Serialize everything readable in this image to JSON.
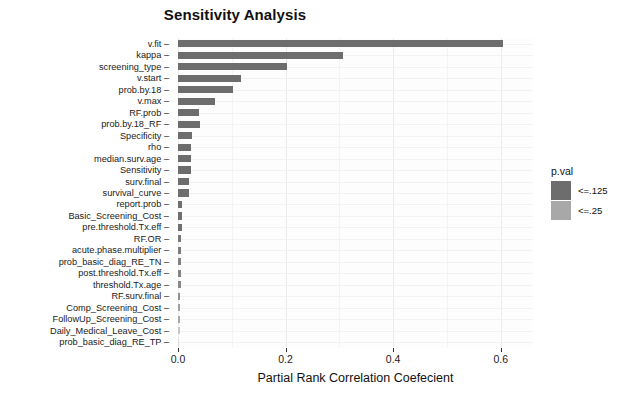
{
  "chart_data": {
    "type": "bar",
    "orientation": "horizontal",
    "title": "Sensitivity Analysis",
    "xlabel": "Partial Rank Correlation Coefecient",
    "ylabel": "",
    "xlim": [
      0.0,
      0.66
    ],
    "xticks": [
      0.0,
      0.2,
      0.4,
      0.6
    ],
    "xticklabels": [
      "0.0",
      "0.2",
      "0.4",
      "0.6"
    ],
    "grid": true,
    "legend_position": "right",
    "legend": {
      "title": "p.val",
      "entries": [
        {
          "label": "<=.125",
          "color": "#6d6d6d"
        },
        {
          "label": "<=.25",
          "color": "#a8a8a8"
        }
      ]
    },
    "categories": [
      "v.fit",
      "kappa",
      "screening_type",
      "v.start",
      "prob.by.18",
      "v.max",
      "RF.prob",
      "prob.by.18_RF",
      "Specificity",
      "rho",
      "median.surv.age",
      "Sensitivity",
      "surv.final",
      "survival_curve",
      "report.prob",
      "Basic_Screening_Cost",
      "pre.threshold.Tx.eff",
      "RF.OR",
      "acute.phase.multiplier",
      "prob_basic_diag_RE_TN",
      "post.threshold.Tx.eff",
      "threshold.Tx.age",
      "RF.surv.final",
      "Comp_Screening_Cost",
      "FollowUp_Screening_Cost",
      "Daily_Medical_Leave_Cost",
      "prob_basic_diag_RE_TP"
    ],
    "values": [
      0.605,
      0.307,
      0.203,
      0.117,
      0.102,
      0.069,
      0.039,
      0.041,
      0.026,
      0.024,
      0.024,
      0.024,
      0.021,
      0.021,
      0.008,
      0.008,
      0.007,
      0.005,
      0.005,
      0.005,
      0.005,
      0.005,
      0.004,
      0.004,
      0.004,
      0.003,
      0.002
    ],
    "groups": [
      "<=.125",
      "<=.125",
      "<=.125",
      "<=.125",
      "<=.125",
      "<=.125",
      "<=.125",
      "<=.125",
      "<=.125",
      "<=.125",
      "<=.125",
      "<=.125",
      "<=.125",
      "<=.125",
      "<=.125",
      "<=.125",
      "<=.125",
      "<=.125",
      "<=.125",
      "<=.125",
      "<=.125",
      "<=.125",
      "<=.125",
      "<=.25",
      "<=.25",
      "<=.25",
      "<=.25"
    ],
    "bar_colors": [
      "#6d6d6d",
      "#6d6d6d",
      "#6d6d6d",
      "#6d6d6d",
      "#6d6d6d",
      "#6d6d6d",
      "#6d6d6d",
      "#6d6d6d",
      "#6d6d6d",
      "#6d6d6d",
      "#6d6d6d",
      "#6d6d6d",
      "#6d6d6d",
      "#6d6d6d",
      "#6f6f6f",
      "#6f6f6f",
      "#707070",
      "#787878",
      "#7c7c7c",
      "#828282",
      "#858585",
      "#888888",
      "#909090",
      "#a0a0a0",
      "#a8a8a8",
      "#c8c8c8",
      "#dcdcdc"
    ]
  },
  "style": {
    "panel_background": "#fdfdfd",
    "grid_color": "#ebebeb",
    "text_color": "#1a1a1a"
  }
}
